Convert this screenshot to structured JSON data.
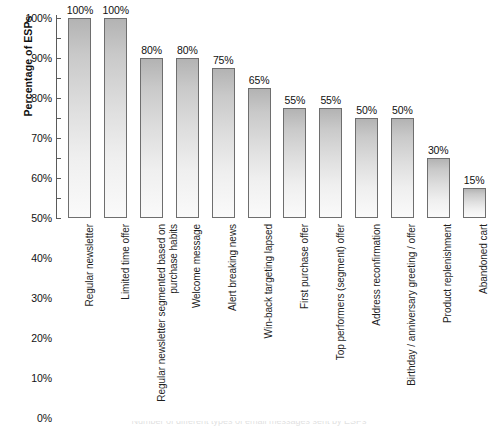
{
  "chart_data": {
    "type": "bar",
    "title": "",
    "subtitle": "",
    "xlabel": "",
    "ylabel": "Percentage of ESPs",
    "ylim": [
      0,
      100
    ],
    "yticks": [
      "0%",
      "10%",
      "20%",
      "30%",
      "40%",
      "50%",
      "60%",
      "70%",
      "80%",
      "90%",
      "100%"
    ],
    "ytick_values": [
      0,
      10,
      20,
      30,
      40,
      50,
      60,
      70,
      80,
      90,
      100
    ],
    "grid": false,
    "legend": null,
    "legend_position": "none",
    "categories": [
      "Regular newsletter",
      "Limited time offer",
      "Regular newsletter segmented based on purchase habits",
      "Welcome message",
      "Alert breaking news",
      "Win-back targeting lapsed",
      "First purchase offer",
      "Top performers (segment) offer",
      "Address reconfirmation",
      "Birthday / anniversary greeting / offer",
      "Product replenishment",
      "Abandoned cart"
    ],
    "values": [
      100,
      100,
      80,
      80,
      75,
      65,
      55,
      55,
      50,
      50,
      30,
      15
    ],
    "data_labels": [
      "100%",
      "100%",
      "80%",
      "80%",
      "75%",
      "65%",
      "55%",
      "55%",
      "50%",
      "50%",
      "30%",
      "15%"
    ],
    "bar_style": {
      "fill_gradient_top": "#b3b3b3",
      "fill_gradient_bottom": "#fafafa",
      "border": "#6e6e6e"
    }
  },
  "axis": {
    "y_title": "Percentage of ESPs",
    "line_color": "#5a5a5a"
  },
  "caption": {
    "remnant": "Number of different types of email messages sent by ESPs"
  }
}
